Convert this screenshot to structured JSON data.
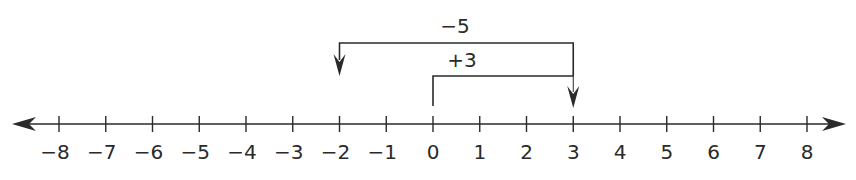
{
  "diagram": {
    "type": "number-line",
    "range": [
      -8,
      8
    ],
    "ticks": [
      "−8",
      "−7",
      "−6",
      "−5",
      "−4",
      "−3",
      "−2",
      "−1",
      "0",
      "1",
      "2",
      "3",
      "4",
      "5",
      "6",
      "7",
      "8"
    ],
    "jumps": [
      {
        "label": "+3",
        "from": 0,
        "to": 3
      },
      {
        "label": "−5",
        "from": 3,
        "to": -2
      }
    ],
    "colors": {
      "line": "#2a2a2a",
      "background": "#ffffff"
    }
  }
}
